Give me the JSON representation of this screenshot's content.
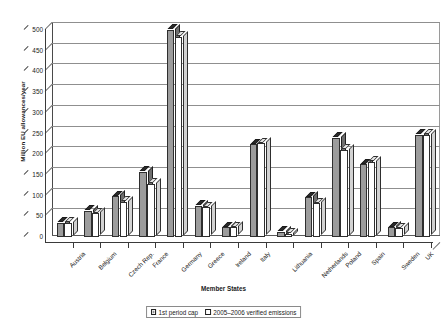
{
  "chart_data": {
    "type": "bar",
    "title": "",
    "xlabel": "Member States",
    "ylabel": "Million EU allowances/year",
    "ylim": [
      0,
      500
    ],
    "ytick_step": 50,
    "yticks": [
      0,
      50,
      100,
      150,
      200,
      250,
      300,
      350,
      400,
      450,
      500
    ],
    "grid": true,
    "legend_position": "bottom-center",
    "style": "3d-clustered-column",
    "categories": [
      "Austria",
      "Belgium",
      "Czech Rep.",
      "France",
      "Germany",
      "Greece",
      "Ireland",
      "Italy",
      "Lithuania",
      "Netherlands",
      "Poland",
      "Spain",
      "Sweden",
      "UK"
    ],
    "series": [
      {
        "name": "1st period cap",
        "color": "#9c9c9c",
        "values": [
          33,
          62,
          97,
          157,
          499,
          74,
          22,
          223,
          12,
          95,
          239,
          174,
          22,
          245
        ]
      },
      {
        "name": "2005–2006 verified emissions",
        "color": "#ffffff",
        "values": [
          33,
          56,
          84,
          127,
          482,
          71,
          22,
          225,
          6.5,
          80,
          209,
          180,
          20,
          245
        ]
      }
    ]
  },
  "legend": {
    "items": [
      {
        "label": "1st period cap",
        "swatch": "cap"
      },
      {
        "label": "2005–2006 verified emissions",
        "swatch": "ver"
      }
    ]
  }
}
